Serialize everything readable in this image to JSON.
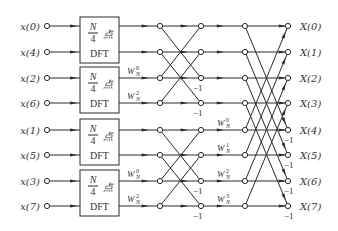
{
  "diagram": {
    "rows_y": [
      26,
      52,
      78,
      103,
      130,
      155,
      181,
      206
    ],
    "inputs": [
      {
        "label": "x(0)"
      },
      {
        "label": "x(4)"
      },
      {
        "label": "x(2)"
      },
      {
        "label": "x(6)"
      },
      {
        "label": "x(1)"
      },
      {
        "label": "x(5)"
      },
      {
        "label": "x(3)"
      },
      {
        "label": "x(7)"
      }
    ],
    "outputs": [
      {
        "label": "X(0)"
      },
      {
        "label": "X(1)"
      },
      {
        "label": "X(2)"
      },
      {
        "label": "X(3)"
      },
      {
        "label": "X(4)"
      },
      {
        "label": "X(5)"
      },
      {
        "label": "X(6)"
      },
      {
        "label": "X(7)"
      }
    ],
    "dft_blocks": [
      {
        "frac_num": "N",
        "frac_den": "4",
        "suffix": "点",
        "name": "DFT"
      },
      {
        "frac_num": "N",
        "frac_den": "4",
        "suffix": "点",
        "name": "DFT"
      },
      {
        "frac_num": "N",
        "frac_den": "4",
        "suffix": "点",
        "name": "DFT"
      },
      {
        "frac_num": "N",
        "frac_den": "4",
        "suffix": "点",
        "name": "DFT"
      }
    ],
    "stage1_twiddles": [
      {
        "row": 2,
        "base": "W",
        "sub": "N",
        "exp": "0"
      },
      {
        "row": 3,
        "base": "W",
        "sub": "N",
        "exp": "2"
      },
      {
        "row": 6,
        "base": "W",
        "sub": "N",
        "exp": "0"
      },
      {
        "row": 7,
        "base": "W",
        "sub": "N",
        "exp": "2"
      }
    ],
    "stage2_twiddles": [
      {
        "row": 4,
        "base": "W",
        "sub": "N",
        "exp": "0"
      },
      {
        "row": 5,
        "base": "W",
        "sub": "N",
        "exp": "1"
      },
      {
        "row": 6,
        "base": "W",
        "sub": "N",
        "exp": "2"
      },
      {
        "row": 7,
        "base": "W",
        "sub": "N",
        "exp": "3"
      }
    ],
    "minus_one_label": "−1",
    "stage1_minus_rows": [
      2,
      3,
      6,
      7
    ],
    "stage2_minus_rows": [
      4,
      5,
      6,
      7
    ],
    "colors": {
      "line": "#2a2a2a",
      "text": "#333333",
      "background": "#ffffff"
    }
  }
}
